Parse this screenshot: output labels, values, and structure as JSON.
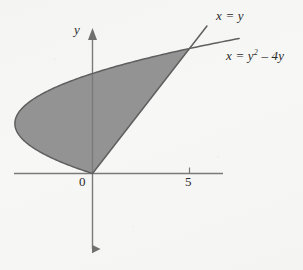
{
  "figure": {
    "background_color": "#f7f7f5",
    "width": 303,
    "height": 270
  },
  "axes": {
    "x_axis_name": "x-axis",
    "y_axis_label": "y",
    "origin_label": "0",
    "tick_labels": [
      "5"
    ],
    "axis_color": "#7a7a7a",
    "arrow_direction_y": "both"
  },
  "curves": {
    "line_label": "x = y",
    "parabola_label_prefix": "x = y",
    "parabola_label_exponent": "2",
    "parabola_label_suffix": " – 4y",
    "curve_color": "#5f5f5f",
    "fill_color": "#8d8d8d"
  },
  "chart_data": {
    "type": "area",
    "title": "",
    "xlabel": "",
    "ylabel": "y",
    "xlim": [
      -4.5,
      7
    ],
    "ylim": [
      -3.2,
      7
    ],
    "grid": false,
    "legend": "inline-annotations",
    "x_ticks": [
      0,
      5
    ],
    "x_tick_labels": [
      "0",
      "5"
    ],
    "y_ticks": [],
    "y_tick_labels": [],
    "annotations": [
      {
        "text": "x = y",
        "x": 6.0,
        "y": 6.1
      },
      {
        "text": "x = y² – 4y",
        "x": 6.5,
        "y": 4.5
      }
    ],
    "series": [
      {
        "name": "x = y",
        "kind": "line",
        "equation": "x = y",
        "points": [
          {
            "y": 0,
            "x": 0
          },
          {
            "y": 1,
            "x": 1
          },
          {
            "y": 2,
            "x": 2
          },
          {
            "y": 3,
            "x": 3
          },
          {
            "y": 4,
            "x": 4
          },
          {
            "y": 5,
            "x": 5
          },
          {
            "y": 5.9,
            "x": 5.9
          }
        ]
      },
      {
        "name": "x = y^2 - 4y",
        "kind": "parabola",
        "equation": "x = y^2 - 4y",
        "vertex": {
          "y": 2,
          "x": -4
        },
        "points": [
          {
            "y": 0,
            "x": 0
          },
          {
            "y": 0.5,
            "x": -1.75
          },
          {
            "y": 1,
            "x": -3
          },
          {
            "y": 1.5,
            "x": -3.75
          },
          {
            "y": 2,
            "x": -4
          },
          {
            "y": 2.5,
            "x": -3.75
          },
          {
            "y": 3,
            "x": -3
          },
          {
            "y": 3.5,
            "x": -1.75
          },
          {
            "y": 4,
            "x": 0
          },
          {
            "y": 4.5,
            "x": 2.25
          },
          {
            "y": 5,
            "x": 5
          },
          {
            "y": 5.4,
            "x": 7.56
          }
        ]
      }
    ],
    "shaded_region": {
      "description": "Region bounded on the right by x = y and on the left by x = y^2 - 4y, for y from 0 to 5",
      "y_from": 0,
      "y_to": 5,
      "intersections": [
        {
          "x": 0,
          "y": 0
        },
        {
          "x": 5,
          "y": 5
        }
      ]
    }
  }
}
